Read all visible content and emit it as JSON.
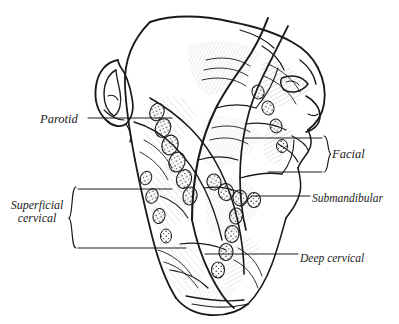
{
  "figure": {
    "type": "anatomical-illustration",
    "style": "pen-and-ink line drawing, black on white",
    "background_color": "#ffffff",
    "ink_color": "#1a1a1a"
  },
  "labels": {
    "parotid": "Parotid",
    "facial": "Facial",
    "submandibular": "Submandibular",
    "deep_cervical": "Deep cervical",
    "superficial_cervical_line1": "Superficial",
    "superficial_cervical_line2": "cervical"
  },
  "annotations": {
    "parotid_leader": "horizontal leader line from label to parotid region",
    "facial_brace": "right-facing brace grouping two facial node leader lines",
    "submandibular_leader": "diagonal leader line to submandibular nodes",
    "deep_cervical_leader": "diagonal leader line to deep cervical chain",
    "superficial_cervical_brace": "left-facing brace grouping two superficial cervical leader lines"
  }
}
